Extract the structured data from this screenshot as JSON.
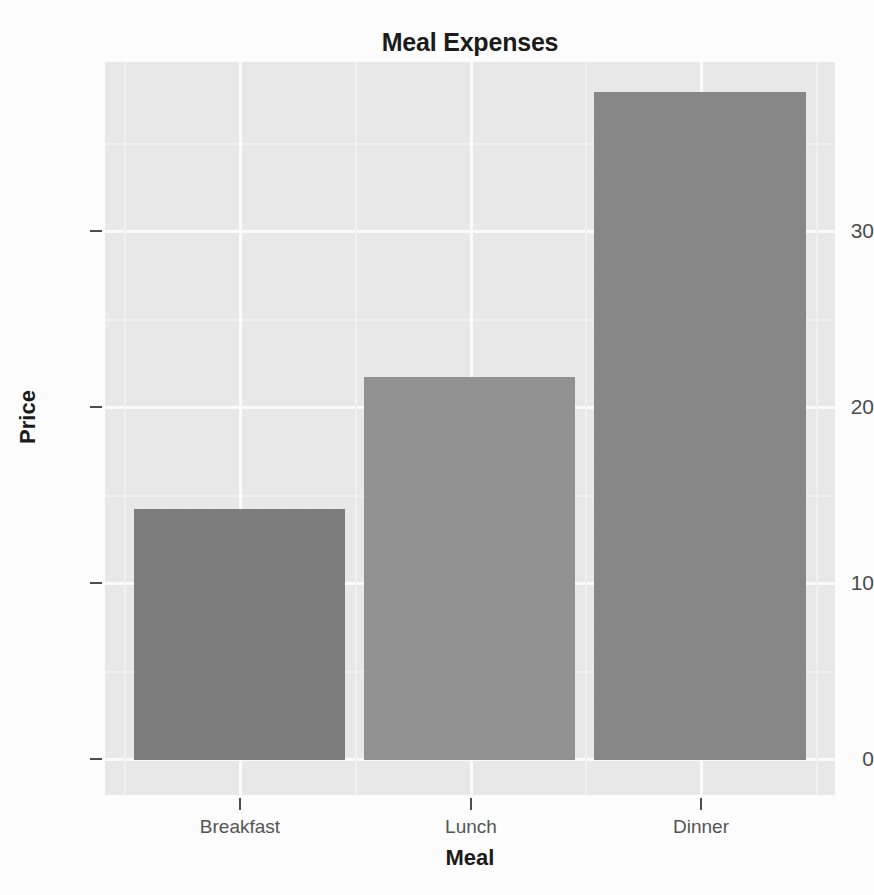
{
  "chart_data": {
    "type": "bar",
    "title": "Meal Expenses",
    "xlabel": "Meal",
    "ylabel": "Price",
    "categories": [
      "Breakfast",
      "Lunch",
      "Dinner"
    ],
    "values": [
      14.2,
      21.7,
      37.8
    ],
    "ylim": [
      0,
      39.5
    ],
    "yticks": [
      0,
      10,
      20,
      30
    ],
    "ytick_labels": [
      "0",
      "10",
      "20",
      "30"
    ],
    "grid": true,
    "grid_color": "#ffffff",
    "minor_grid": true,
    "legend": "none",
    "panel_background": "#eaeaea",
    "bar_colors": [
      "#7e7e7e",
      "#939393",
      "#888888"
    ],
    "series": [
      {
        "name": "Price",
        "points": [
          {
            "category": "Breakfast",
            "value": 14.2,
            "color": "#7e7e7e"
          },
          {
            "category": "Lunch",
            "value": 21.7,
            "color": "#939393"
          },
          {
            "category": "Dinner",
            "value": 37.8,
            "color": "#888888"
          }
        ]
      }
    ]
  },
  "axis": {
    "y_tick_labels": [
      "30",
      "20",
      "10",
      "0"
    ],
    "x_tick_labels": [
      "Breakfast",
      "Lunch",
      "Dinner"
    ]
  }
}
